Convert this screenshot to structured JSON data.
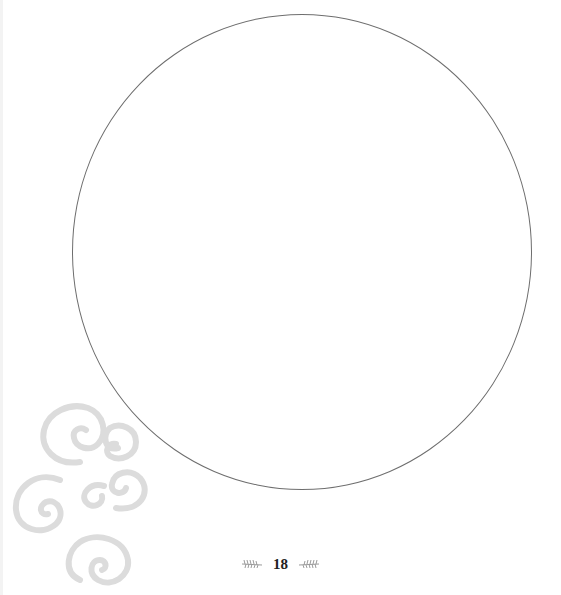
{
  "page": {
    "number": "18",
    "colors": {
      "background": "#ffffff",
      "circle_outline": "#6e6e6e",
      "swirl": "#dcdcdc",
      "ornament": "#9a9a9a"
    },
    "shapes": {
      "circle": "blank-circle-outline",
      "decoration": "spiral-swirls",
      "footer_ornaments": [
        "left-sprig",
        "right-sprig"
      ]
    }
  }
}
